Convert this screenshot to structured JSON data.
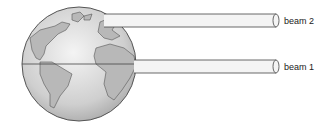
{
  "diagram": {
    "beams": [
      {
        "id": "beam2",
        "label": "beam 2"
      },
      {
        "id": "beam1",
        "label": "beam 1"
      }
    ],
    "colors": {
      "globe_fill": "#d9d9d9",
      "land_fill": "#b5b5b5",
      "outline": "#444444",
      "beam_fill": "#f2f2f2"
    }
  }
}
